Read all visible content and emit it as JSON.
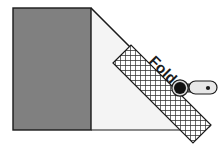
{
  "illustration": {
    "title": "Fold diagram with roller tool",
    "labels": {
      "fold": "Fold"
    },
    "colors": {
      "background": "#ffffff",
      "dark_panel": "#808080",
      "light_panel": "#f4f4f4",
      "outline": "#1a1a1a",
      "hatch_line": "#2b2b2b",
      "hatch_fill": "#ffffff",
      "roller_head": "#111111",
      "roller_handle": "#e8e8e8",
      "roller_handle_edge": "#2b2b2b",
      "roller_neck": "#6e6e6e"
    },
    "geometry": {
      "dark_panel": {
        "x": 13,
        "y": 8,
        "width": 78,
        "height": 122
      },
      "light_panel_points": "91,8 91,130 206,130",
      "fold_line": {
        "x1": 91,
        "y1": 8,
        "x2": 210,
        "y2": 127
      },
      "hatch_band": {
        "angle_deg": 45,
        "points": "113,63 131,45 211,125 193,143",
        "cell_size": 5
      },
      "fold_text": {
        "x": 148,
        "y": 63,
        "rotation_deg": 45
      },
      "roller": {
        "head_center": {
          "x": 181,
          "y": 88
        },
        "head_radius": 7,
        "handle_x": 188,
        "handle_y": 81,
        "handle_width": 28,
        "handle_height": 13,
        "dot_center": {
          "x": 208,
          "y": 88
        },
        "dot_radius": 2
      }
    }
  }
}
